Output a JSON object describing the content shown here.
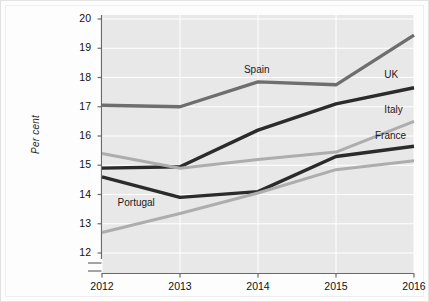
{
  "chart_data": {
    "type": "line",
    "title": "",
    "subtitle": "",
    "xlabel": "",
    "ylabel": "Per cent",
    "x": [
      2012,
      2013,
      2014,
      2015,
      2016
    ],
    "categories": [
      "2012",
      "2013",
      "2014",
      "2015",
      "2016"
    ],
    "xlim": [
      2012,
      2016
    ],
    "ylim": [
      11.8,
      20.2
    ],
    "yticks": [
      12,
      13,
      14,
      15,
      16,
      17,
      18,
      19,
      20
    ],
    "ytick_labels": [
      "12",
      "13",
      "14",
      "15",
      "16",
      "17",
      "18",
      "19",
      "20"
    ],
    "xticks": [
      2012,
      2013,
      2014,
      2015,
      2016
    ],
    "xtick_labels": [
      "2012",
      "2013",
      "2014",
      "2015",
      "2016"
    ],
    "grid": true,
    "grid_color": "#ffffff",
    "plot_background": "#e8e8e8",
    "axis_break": true,
    "legend_position": "inline-labels",
    "series": [
      {
        "name": "Spain",
        "color": "#6e6e6e",
        "width": 3.4,
        "label_x": 2013.82,
        "label_y": 18.22,
        "values": [
          17.05,
          17.0,
          17.85,
          17.75,
          19.45
        ]
      },
      {
        "name": "UK",
        "color": "#2b2b2b",
        "width": 3.4,
        "label_x": 2015.62,
        "label_y": 18.05,
        "values": [
          14.9,
          14.95,
          16.2,
          17.1,
          17.65
        ]
      },
      {
        "name": "Italy",
        "color": "#adadad",
        "width": 3.0,
        "label_x": 2015.62,
        "label_y": 16.85,
        "values": [
          15.4,
          14.9,
          15.2,
          15.45,
          16.5
        ]
      },
      {
        "name": "France",
        "color": "#2b2b2b",
        "width": 3.4,
        "label_x": 2015.5,
        "label_y": 15.98,
        "values": [
          14.6,
          13.9,
          14.1,
          15.3,
          15.65
        ]
      },
      {
        "name": "Portugal",
        "color": "#adadad",
        "width": 3.0,
        "label_x": 2012.2,
        "label_y": 13.68,
        "values": [
          12.7,
          13.35,
          14.05,
          14.85,
          15.15
        ]
      }
    ]
  }
}
